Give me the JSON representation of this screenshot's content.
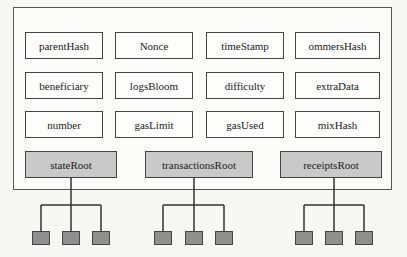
{
  "diagram": {
    "fields": [
      [
        "parentHash",
        "Nonce",
        "timeStamp",
        "ommersHash"
      ],
      [
        "beneficiary",
        "logsBloom",
        "difficulty",
        "extraData"
      ],
      [
        "number",
        "gasLimit",
        "gasUsed",
        "mixHash"
      ]
    ],
    "roots": [
      "stateRoot",
      "transactionsRoot",
      "receiptsRoot"
    ],
    "leaves_per_root": 3,
    "colors": {
      "root_fill": "#c9c9c9",
      "leaf_fill": "#8f8f8f",
      "stroke": "#444444"
    }
  }
}
